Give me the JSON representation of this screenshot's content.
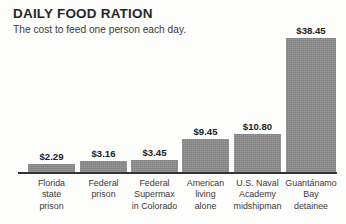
{
  "header": {
    "title": "DAILY FOOD RATION",
    "subtitle": "The cost to feed one person each day."
  },
  "chart_data": {
    "type": "bar",
    "title": "DAILY FOOD RATION",
    "subtitle": "The cost to feed one person each day.",
    "xlabel": "",
    "ylabel": "",
    "ylim": [
      0,
      38.45
    ],
    "grid": false,
    "legend": null,
    "value_prefix": "$",
    "categories": [
      "Florida state prison",
      "Federal prison",
      "Federal Supermax in Colorado",
      "American living alone",
      "U.S. Naval Academy midshipman",
      "Guantánamo Bay detainee"
    ],
    "values": [
      2.29,
      3.16,
      3.45,
      9.45,
      10.8,
      38.45
    ],
    "value_labels": [
      "$2.29",
      "$3.16",
      "$3.45",
      "$9.45",
      "$10.80",
      "$38.45"
    ],
    "tick_labels": [
      [
        "Florida",
        "state",
        "prison"
      ],
      [
        "Federal",
        "prison"
      ],
      [
        "Federal",
        "Supermax",
        "in Colorado"
      ],
      [
        "American",
        "living",
        "alone"
      ],
      [
        "U.S. Naval",
        "Academy",
        "midshipman"
      ],
      [
        "Guantánamo",
        "Bay",
        "detainee"
      ]
    ],
    "bar_color": "#8d8d8d",
    "axis_color": "#333333"
  },
  "bars": [
    {
      "value_label": "$2.29",
      "value": 2.29,
      "lines": [
        "Florida",
        "state",
        "prison"
      ],
      "left": 28,
      "width": 47
    },
    {
      "value_label": "$3.16",
      "value": 3.16,
      "lines": [
        "Federal",
        "prison"
      ],
      "left": 80,
      "width": 47
    },
    {
      "value_label": "$3.45",
      "value": 3.45,
      "lines": [
        "Federal",
        "Supermax",
        "in Colorado"
      ],
      "left": 131,
      "width": 47
    },
    {
      "value_label": "$9.45",
      "value": 9.45,
      "lines": [
        "American",
        "living",
        "alone"
      ],
      "left": 182,
      "width": 47
    },
    {
      "value_label": "$10.80",
      "value": 10.8,
      "lines": [
        "U.S. Naval",
        "Academy",
        "midshipman"
      ],
      "left": 234,
      "width": 47
    },
    {
      "value_label": "$38.45",
      "value": 38.45,
      "lines": [
        "Guantánamo",
        "Bay",
        "detainee"
      ],
      "left": 286,
      "width": 50
    }
  ],
  "axis": {
    "left": 18,
    "right": 337,
    "baseline_y": 172
  }
}
